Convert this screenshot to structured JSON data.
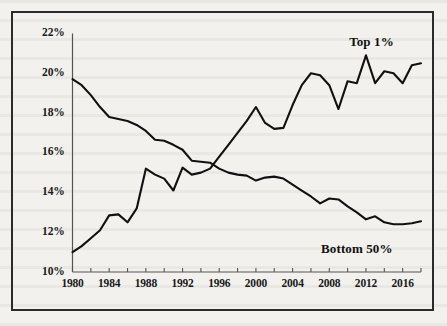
{
  "chart_data": {
    "type": "line",
    "title": "",
    "subtitle": "",
    "xlabel": "",
    "ylabel": "",
    "xlim": [
      1980,
      2018
    ],
    "ylim": [
      10,
      22
    ],
    "yticks": [
      "10%",
      "12%",
      "14%",
      "16%",
      "18%",
      "20%",
      "22%"
    ],
    "ytick_values": [
      10,
      12,
      14,
      16,
      18,
      20,
      22
    ],
    "xticks": [
      "1980",
      "1984",
      "1988",
      "1992",
      "1996",
      "2000",
      "2004",
      "2008",
      "2012",
      "2016"
    ],
    "xtick_values": [
      1980,
      1984,
      1988,
      1992,
      1996,
      2000,
      2004,
      2008,
      2012,
      2016
    ],
    "minor_xtick_values": [
      1982,
      1986,
      1990,
      1994,
      1998,
      2002,
      2006,
      2010,
      2014,
      2018
    ],
    "grid": false,
    "legend_position": "inline-annotations",
    "axis_color": "#555555",
    "line_color": "#111111",
    "x": [
      1980,
      1981,
      1982,
      1983,
      1984,
      1985,
      1986,
      1987,
      1988,
      1989,
      1990,
      1991,
      1992,
      1993,
      1994,
      1995,
      1996,
      1997,
      1998,
      1999,
      2000,
      2001,
      2002,
      2003,
      2004,
      2005,
      2006,
      2007,
      2008,
      2009,
      2010,
      2011,
      2012,
      2013,
      2014,
      2015,
      2016,
      2017,
      2018
    ],
    "series": [
      {
        "name": "Top 1%",
        "label": "Top 1%",
        "label_x": 2012.6,
        "label_y": 21.55,
        "values": [
          11.0,
          11.3,
          11.7,
          12.1,
          12.85,
          12.9,
          12.5,
          13.2,
          15.2,
          14.9,
          14.7,
          14.1,
          15.25,
          14.9,
          15.0,
          15.2,
          15.8,
          16.4,
          17.0,
          17.6,
          18.3,
          17.5,
          17.2,
          17.25,
          18.4,
          19.4,
          20.0,
          19.9,
          19.4,
          18.2,
          19.6,
          19.5,
          20.9,
          19.5,
          20.1,
          20.0,
          19.5,
          20.4,
          20.5
        ]
      },
      {
        "name": "Bottom 50%",
        "label": "Bottom 50%",
        "label_x": 2011.0,
        "label_y": 11.15,
        "values": [
          19.7,
          19.4,
          18.9,
          18.3,
          17.8,
          17.7,
          17.6,
          17.4,
          17.1,
          16.65,
          16.6,
          16.4,
          16.15,
          15.6,
          15.55,
          15.5,
          15.2,
          15.0,
          14.9,
          14.85,
          14.6,
          14.75,
          14.8,
          14.7,
          14.4,
          14.1,
          13.8,
          13.45,
          13.7,
          13.65,
          13.3,
          13.0,
          12.65,
          12.8,
          12.5,
          12.4,
          12.4,
          12.45,
          12.55
        ]
      }
    ]
  },
  "figure": {
    "frame_label": "chart-border"
  }
}
